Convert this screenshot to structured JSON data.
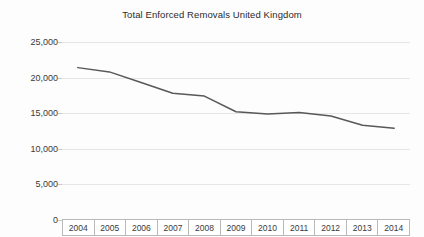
{
  "chart_data": {
    "type": "line",
    "title": "Total Enforced Removals United Kingdom",
    "xlabel": "",
    "ylabel": "",
    "categories": [
      "2004",
      "2005",
      "2006",
      "2007",
      "2008",
      "2009",
      "2010",
      "2011",
      "2012",
      "2013",
      "2014"
    ],
    "values": [
      21400,
      20800,
      19300,
      17800,
      17400,
      15200,
      14900,
      15100,
      14600,
      13300,
      12900
    ],
    "series": [
      {
        "name": "Total Enforced Removals United Kingdom",
        "values": [
          21400,
          20800,
          19300,
          17800,
          17400,
          15200,
          14900,
          15100,
          14600,
          13300,
          12900
        ]
      }
    ],
    "ylim": [
      0,
      25000
    ],
    "y_ticks": [
      0,
      5000,
      10000,
      15000,
      20000,
      25000
    ],
    "y_tick_labels": [
      "0",
      "5,000",
      "10,000",
      "15,000",
      "20,000",
      "25,000"
    ],
    "grid": true,
    "legend": "none",
    "line_color": "#58585a",
    "grid_color": "#e6e6e6",
    "background_color": "#fdfdfd"
  },
  "axis": {
    "y_labels": [
      "25,000",
      "20,000",
      "15,000",
      "10,000",
      "5,000",
      "0"
    ],
    "x_labels": [
      "2004",
      "2005",
      "2006",
      "2007",
      "2008",
      "2009",
      "2010",
      "2011",
      "2012",
      "2013",
      "2014"
    ]
  }
}
